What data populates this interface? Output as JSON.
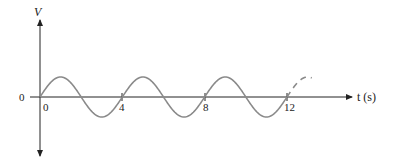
{
  "chart_data": {
    "type": "line",
    "title": "",
    "xlabel": "t (s)",
    "ylabel": "V",
    "x_ticks": [
      "0",
      "4",
      "8",
      "12"
    ],
    "y_ticks": [
      "0"
    ],
    "series": [
      {
        "name": "V(t)",
        "function": "sine",
        "period": 4,
        "amplitude": 1,
        "x_range": [
          0,
          12
        ],
        "dashed_extension": [
          12,
          13.2
        ],
        "x": [
          0,
          1,
          2,
          3,
          4,
          5,
          6,
          7,
          8,
          9,
          10,
          11,
          12
        ],
        "values": [
          0,
          1,
          0,
          -1,
          0,
          1,
          0,
          -1,
          0,
          1,
          0,
          -1,
          0
        ]
      }
    ],
    "grid": false,
    "legend": null
  },
  "labels": {
    "y_axis": "V",
    "x_axis": "t (s)",
    "y_zero": "0",
    "x_zero": "0",
    "tick_4": "4",
    "tick_8": "8",
    "tick_12": "12"
  },
  "colors": {
    "curve": "#8a8a8a",
    "axis": "#222222"
  }
}
